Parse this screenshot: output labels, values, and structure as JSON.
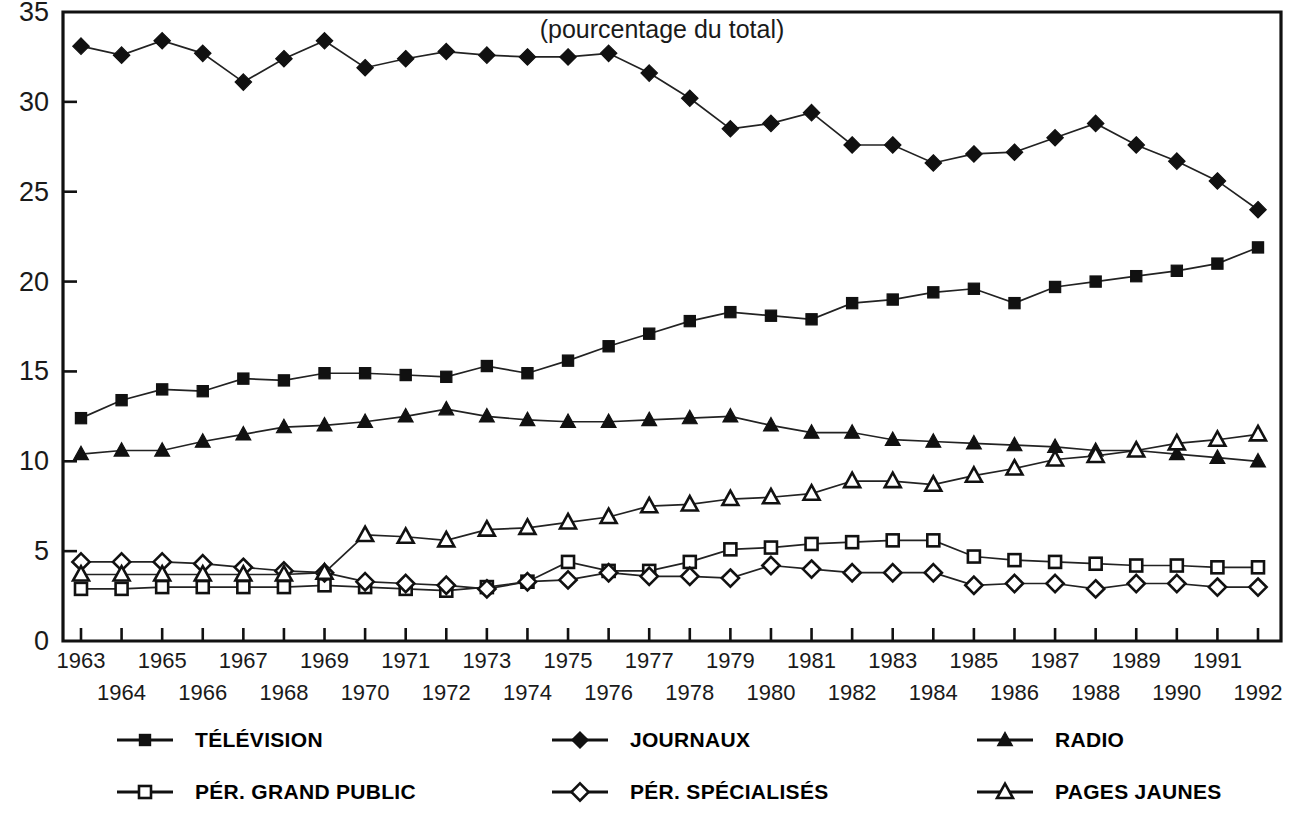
{
  "chart_data": {
    "type": "line",
    "title": "(pourcentage du total)",
    "xlabel": "",
    "ylabel": "",
    "ylim": [
      0,
      35
    ],
    "yticks": [
      0,
      5,
      10,
      15,
      20,
      25,
      30,
      35
    ],
    "ytick_labels": [
      "0",
      "5",
      "10",
      "15",
      "20",
      "25",
      "30",
      "35"
    ],
    "grid": false,
    "legend_position": "bottom",
    "x": [
      1963,
      1964,
      1965,
      1966,
      1967,
      1968,
      1969,
      1970,
      1971,
      1972,
      1973,
      1974,
      1975,
      1976,
      1977,
      1978,
      1979,
      1980,
      1981,
      1982,
      1983,
      1984,
      1985,
      1986,
      1987,
      1988,
      1989,
      1990,
      1991,
      1992
    ],
    "categories": [
      "1963",
      "1964",
      "1965",
      "1966",
      "1967",
      "1968",
      "1969",
      "1970",
      "1971",
      "1972",
      "1973",
      "1974",
      "1975",
      "1976",
      "1977",
      "1978",
      "1979",
      "1980",
      "1981",
      "1982",
      "1983",
      "1984",
      "1985",
      "1986",
      "1987",
      "1988",
      "1989",
      "1990",
      "1991",
      "1992"
    ],
    "xtick_labels_top": [
      "1963",
      "",
      "1965",
      "",
      "1967",
      "",
      "1969",
      "",
      "1971",
      "",
      "1973",
      "",
      "1975",
      "",
      "1977",
      "",
      "1979",
      "",
      "1981",
      "",
      "1983",
      "",
      "1985",
      "",
      "1987",
      "",
      "1989",
      "",
      "1991",
      ""
    ],
    "xtick_labels_bottom": [
      "",
      "1964",
      "",
      "1966",
      "",
      "1968",
      "",
      "1970",
      "",
      "1972",
      "",
      "1974",
      "",
      "1976",
      "",
      "1978",
      "",
      "1980",
      "",
      "1982",
      "",
      "1984",
      "",
      "1986",
      "",
      "1988",
      "",
      "1990",
      "",
      "1992"
    ],
    "series": [
      {
        "name": "TÉLÉVISION",
        "marker": "filled-square",
        "values": [
          12.4,
          13.4,
          14.0,
          13.9,
          14.6,
          14.5,
          14.9,
          14.9,
          14.8,
          14.7,
          15.3,
          14.9,
          15.6,
          16.4,
          17.1,
          17.8,
          18.3,
          18.1,
          17.9,
          18.8,
          19.0,
          19.4,
          19.6,
          18.8,
          19.7,
          20.0,
          20.3,
          20.6,
          21.0,
          21.9
        ]
      },
      {
        "name": "JOURNAUX",
        "marker": "filled-diamond",
        "values": [
          33.1,
          32.6,
          33.4,
          32.7,
          31.1,
          32.4,
          33.4,
          31.9,
          32.4,
          32.8,
          32.6,
          32.5,
          32.5,
          32.7,
          31.6,
          30.2,
          28.5,
          28.8,
          29.4,
          27.6,
          27.6,
          26.6,
          27.1,
          27.2,
          28.0,
          28.8,
          27.6,
          26.7,
          25.6,
          24.0
        ]
      },
      {
        "name": "RADIO",
        "marker": "filled-triangle",
        "values": [
          10.4,
          10.6,
          10.6,
          11.1,
          11.5,
          11.9,
          12.0,
          12.2,
          12.5,
          12.9,
          12.5,
          12.3,
          12.2,
          12.2,
          12.3,
          12.4,
          12.5,
          12.0,
          11.6,
          11.6,
          11.2,
          11.1,
          11.0,
          10.9,
          10.8,
          10.6,
          10.6,
          10.4,
          10.2,
          10.0
        ]
      },
      {
        "name": "PÉR. GRAND PUBLIC",
        "marker": "open-square",
        "values": [
          2.9,
          2.9,
          3.0,
          3.0,
          3.0,
          3.0,
          3.1,
          3.0,
          2.9,
          2.8,
          3.0,
          3.3,
          4.4,
          3.9,
          3.9,
          4.4,
          5.1,
          5.2,
          5.4,
          5.5,
          5.6,
          5.6,
          4.7,
          4.5,
          4.4,
          4.3,
          4.2,
          4.2,
          4.1,
          4.1
        ]
      },
      {
        "name": "PÉR. SPÉCIALISÉS",
        "marker": "open-diamond",
        "values": [
          4.4,
          4.4,
          4.4,
          4.3,
          4.1,
          3.9,
          3.8,
          3.3,
          3.2,
          3.1,
          2.9,
          3.3,
          3.4,
          3.8,
          3.6,
          3.6,
          3.5,
          4.2,
          4.0,
          3.8,
          3.8,
          3.8,
          3.1,
          3.2,
          3.2,
          2.9,
          3.2,
          3.2,
          3.0,
          3.0
        ]
      },
      {
        "name": "PAGES JAUNES",
        "marker": "open-triangle",
        "values": [
          3.7,
          3.7,
          3.7,
          3.7,
          3.7,
          3.7,
          3.8,
          5.9,
          5.8,
          5.6,
          6.2,
          6.3,
          6.6,
          6.9,
          7.5,
          7.6,
          7.9,
          8.0,
          8.2,
          8.9,
          8.9,
          8.7,
          9.2,
          9.6,
          10.1,
          10.3,
          10.6,
          11.0,
          11.2,
          11.5
        ]
      }
    ]
  },
  "legend": {
    "items": [
      {
        "label": "TÉLÉVISION",
        "marker": "filled-square"
      },
      {
        "label": "JOURNAUX",
        "marker": "filled-diamond"
      },
      {
        "label": "RADIO",
        "marker": "filled-triangle"
      },
      {
        "label": "PÉR. GRAND PUBLIC",
        "marker": "open-square"
      },
      {
        "label": "PÉR. SPÉCIALISÉS",
        "marker": "open-diamond"
      },
      {
        "label": "PAGES JAUNES",
        "marker": "open-triangle"
      }
    ]
  },
  "colors": {
    "ink": "#111111",
    "background": "#ffffff"
  }
}
